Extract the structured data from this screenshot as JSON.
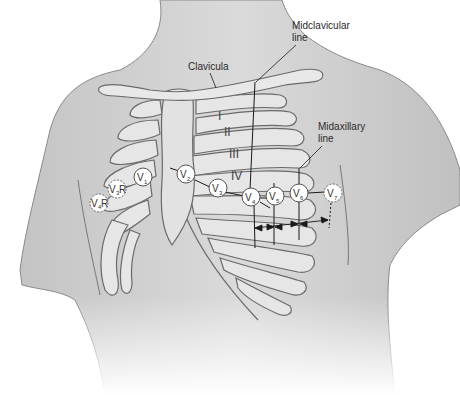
{
  "figure": {
    "colors": {
      "background": "#ffffff",
      "skin_fill": "#d4d4d4",
      "skin_shadow": "#b8b8b8",
      "bone_fill": "#e8e8e8",
      "bone_stroke": "#6a6a6a",
      "line": "#1a1a1a",
      "electrode_fill": "#ffffff",
      "electrode_stroke": "#555555"
    }
  },
  "labels": {
    "clavicula": "Clavicula",
    "midclavicular_line_1": "Midclavicular",
    "midclavicular_line_2": "line",
    "midaxillary_line_1": "Midaxillary",
    "midaxillary_line_2": "line"
  },
  "intercostal_spaces": [
    {
      "label": "I"
    },
    {
      "label": "II"
    },
    {
      "label": "III"
    },
    {
      "label": "IV"
    }
  ],
  "electrodes": [
    {
      "id": "V1",
      "main": "V",
      "sub": "1",
      "suffix": "",
      "style": "solid"
    },
    {
      "id": "V2",
      "main": "V",
      "sub": "2",
      "suffix": "",
      "style": "solid"
    },
    {
      "id": "V3",
      "main": "V",
      "sub": "3",
      "suffix": "",
      "style": "solid"
    },
    {
      "id": "V4",
      "main": "V",
      "sub": "4",
      "suffix": "",
      "style": "solid"
    },
    {
      "id": "V5",
      "main": "V",
      "sub": "5",
      "suffix": "",
      "style": "solid"
    },
    {
      "id": "V6",
      "main": "V",
      "sub": "6",
      "suffix": "",
      "style": "solid"
    },
    {
      "id": "V7",
      "main": "V",
      "sub": "7",
      "suffix": "",
      "style": "dashed"
    },
    {
      "id": "V3R",
      "main": "V",
      "sub": "3",
      "suffix": "R",
      "style": "dashed"
    },
    {
      "id": "V4R",
      "main": "V",
      "sub": "4",
      "suffix": "R",
      "style": "dashed"
    }
  ]
}
